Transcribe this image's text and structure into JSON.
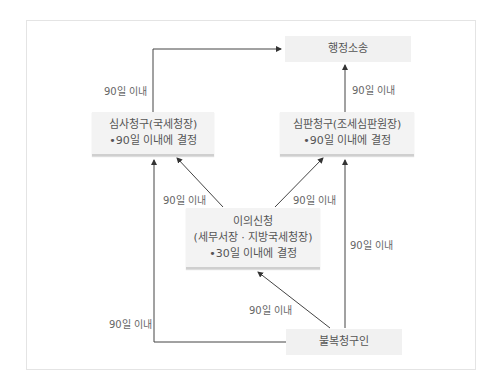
{
  "diagram": {
    "title": "",
    "nodes": {
      "litigation": {
        "label": "행정소송"
      },
      "review": {
        "line1": "심사청구(국세청장)",
        "line2": "•90일 이내에 결정"
      },
      "trial": {
        "line1": "심판청구(조세심판원장)",
        "line2": "•90일 이내에 결정"
      },
      "objection": {
        "line1": "이의신청",
        "line2": "(세무서장 · 지방국세청장)",
        "line3": "•30일 이내에 결정"
      },
      "claimant": {
        "label": "불복청구인"
      }
    },
    "edge_labels": {
      "review_to_litigation": "90일 이내",
      "trial_to_litigation": "90일 이내",
      "objection_to_review": "90일 이내",
      "objection_to_trial": "90일 이내",
      "claimant_to_objection": "90일 이내",
      "claimant_to_review": "90일 이내",
      "claimant_to_trial": "90일 이내"
    },
    "colors": {
      "line": "#333333",
      "box": "#f3f3f3",
      "text": "#555555"
    }
  }
}
